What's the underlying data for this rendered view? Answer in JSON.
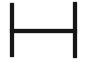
{
  "figure": {
    "shape": "h-shape",
    "text": "",
    "colors": {
      "ink": "#161616",
      "background": "#ffffff"
    }
  }
}
